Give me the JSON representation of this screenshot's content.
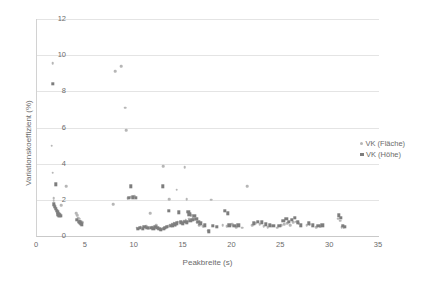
{
  "chart_data": {
    "type": "scatter",
    "title": "",
    "xlabel": "Peakbreite (s)",
    "ylabel": "Variationskoeffizient (%)",
    "xlim": [
      0,
      35
    ],
    "ylim": [
      0,
      12
    ],
    "xticks": [
      0,
      5,
      10,
      15,
      20,
      25,
      30,
      35
    ],
    "yticks": [
      0,
      2,
      4,
      6,
      8,
      10,
      12
    ],
    "grid": "horizontal",
    "legend_position": "right",
    "colors": {
      "flaeche": "#b6b6b6",
      "hoehe": "#7d7d7d",
      "gridline": "#e4e4e4",
      "axis": "#c9c9c9",
      "text": "#6b6b6b"
    },
    "series": [
      {
        "name": "VK (Fläche)",
        "marker": "circle",
        "color": "#b6b6b6",
        "points": [
          [
            1.6,
            9.55
          ],
          [
            1.5,
            5.0
          ],
          [
            1.6,
            3.5
          ],
          [
            1.7,
            2.1
          ],
          [
            1.7,
            1.95
          ],
          [
            1.8,
            1.7
          ],
          [
            1.9,
            1.55
          ],
          [
            2.0,
            1.45
          ],
          [
            2.1,
            1.3
          ],
          [
            2.3,
            1.2
          ],
          [
            2.5,
            1.7
          ],
          [
            3.0,
            2.75
          ],
          [
            4.0,
            1.25
          ],
          [
            4.1,
            1.15
          ],
          [
            4.2,
            1.0
          ],
          [
            4.3,
            0.95
          ],
          [
            4.4,
            0.85
          ],
          [
            4.5,
            0.8
          ],
          [
            4.6,
            0.75
          ],
          [
            7.8,
            1.75
          ],
          [
            8.0,
            9.1
          ],
          [
            8.6,
            9.4
          ],
          [
            9.0,
            7.1
          ],
          [
            9.1,
            5.85
          ],
          [
            9.3,
            2.1
          ],
          [
            9.6,
            2.15
          ],
          [
            10.0,
            2.2
          ],
          [
            10.2,
            0.45
          ],
          [
            10.4,
            0.4
          ],
          [
            10.6,
            0.5
          ],
          [
            10.9,
            0.45
          ],
          [
            11.2,
            0.55
          ],
          [
            11.4,
            0.4
          ],
          [
            11.6,
            1.25
          ],
          [
            11.8,
            0.5
          ],
          [
            12.0,
            0.45
          ],
          [
            12.2,
            0.6
          ],
          [
            12.4,
            0.4
          ],
          [
            12.6,
            0.35
          ],
          [
            12.8,
            0.4
          ],
          [
            12.9,
            3.85
          ],
          [
            13.0,
            0.45
          ],
          [
            13.2,
            0.5
          ],
          [
            13.4,
            0.55
          ],
          [
            13.5,
            2.05
          ],
          [
            13.6,
            0.6
          ],
          [
            13.8,
            0.65
          ],
          [
            14.0,
            0.7
          ],
          [
            14.2,
            0.6
          ],
          [
            14.3,
            2.55
          ],
          [
            14.4,
            0.75
          ],
          [
            14.6,
            0.8
          ],
          [
            14.8,
            0.7
          ],
          [
            15.0,
            0.85
          ],
          [
            15.1,
            3.8
          ],
          [
            15.2,
            0.9
          ],
          [
            15.3,
            2.05
          ],
          [
            15.4,
            0.8
          ],
          [
            15.6,
            0.95
          ],
          [
            15.8,
            1.15
          ],
          [
            16.0,
            1.0
          ],
          [
            16.2,
            0.9
          ],
          [
            16.4,
            0.75
          ],
          [
            16.6,
            0.6
          ],
          [
            17.0,
            0.55
          ],
          [
            17.5,
            0.3
          ],
          [
            17.8,
            2.0
          ],
          [
            19.0,
            0.6
          ],
          [
            19.4,
            0.55
          ],
          [
            20.0,
            0.65
          ],
          [
            20.4,
            0.5
          ],
          [
            21.0,
            0.45
          ],
          [
            21.5,
            2.75
          ],
          [
            22.0,
            0.6
          ],
          [
            22.4,
            0.7
          ],
          [
            22.8,
            0.65
          ],
          [
            23.2,
            0.55
          ],
          [
            23.6,
            0.5
          ],
          [
            24.6,
            0.45
          ],
          [
            25.0,
            0.6
          ],
          [
            25.3,
            0.65
          ],
          [
            25.6,
            0.7
          ],
          [
            25.9,
            0.6
          ],
          [
            26.2,
            0.75
          ],
          [
            26.5,
            0.8
          ],
          [
            26.8,
            0.7
          ],
          [
            27.6,
            0.6
          ],
          [
            27.9,
            0.65
          ],
          [
            28.6,
            0.5
          ],
          [
            29.0,
            0.55
          ],
          [
            30.8,
            0.95
          ],
          [
            31.0,
            0.85
          ],
          [
            31.2,
            0.5
          ],
          [
            31.4,
            0.45
          ]
        ]
      },
      {
        "name": "VK (Höhe)",
        "marker": "square",
        "color": "#7d7d7d",
        "points": [
          [
            1.6,
            8.4
          ],
          [
            1.9,
            2.85
          ],
          [
            1.7,
            1.75
          ],
          [
            1.8,
            1.6
          ],
          [
            1.9,
            1.5
          ],
          [
            2.0,
            1.4
          ],
          [
            2.1,
            1.3
          ],
          [
            2.2,
            1.2
          ],
          [
            2.3,
            1.15
          ],
          [
            2.4,
            1.1
          ],
          [
            4.1,
            0.9
          ],
          [
            4.3,
            0.8
          ],
          [
            4.4,
            0.75
          ],
          [
            4.5,
            0.7
          ],
          [
            4.6,
            0.65
          ],
          [
            9.6,
            2.75
          ],
          [
            9.4,
            2.1
          ],
          [
            9.8,
            2.15
          ],
          [
            10.1,
            2.1
          ],
          [
            10.3,
            0.4
          ],
          [
            10.5,
            0.45
          ],
          [
            10.8,
            0.4
          ],
          [
            11.0,
            0.5
          ],
          [
            11.3,
            0.45
          ],
          [
            11.7,
            0.45
          ],
          [
            11.9,
            0.4
          ],
          [
            12.1,
            0.5
          ],
          [
            12.3,
            0.45
          ],
          [
            12.5,
            0.4
          ],
          [
            12.7,
            0.35
          ],
          [
            12.9,
            2.75
          ],
          [
            13.0,
            0.4
          ],
          [
            13.1,
            0.45
          ],
          [
            13.3,
            0.5
          ],
          [
            13.5,
            1.4
          ],
          [
            13.7,
            0.55
          ],
          [
            13.9,
            0.6
          ],
          [
            14.1,
            0.65
          ],
          [
            14.3,
            0.7
          ],
          [
            14.5,
            1.3
          ],
          [
            14.7,
            0.75
          ],
          [
            14.9,
            0.7
          ],
          [
            15.1,
            0.8
          ],
          [
            15.3,
            0.75
          ],
          [
            15.5,
            1.35
          ],
          [
            15.6,
            1.2
          ],
          [
            15.7,
            0.85
          ],
          [
            15.9,
            0.9
          ],
          [
            16.1,
            1.1
          ],
          [
            16.3,
            0.95
          ],
          [
            16.5,
            0.8
          ],
          [
            16.7,
            0.7
          ],
          [
            17.2,
            0.6
          ],
          [
            17.6,
            0.25
          ],
          [
            18.0,
            0.55
          ],
          [
            18.4,
            0.5
          ],
          [
            19.2,
            1.4
          ],
          [
            19.5,
            1.25
          ],
          [
            19.7,
            0.6
          ],
          [
            20.2,
            0.55
          ],
          [
            20.6,
            0.6
          ],
          [
            22.2,
            0.7
          ],
          [
            22.6,
            0.8
          ],
          [
            23.0,
            0.75
          ],
          [
            23.4,
            0.65
          ],
          [
            23.8,
            0.6
          ],
          [
            24.2,
            0.55
          ],
          [
            24.8,
            0.55
          ],
          [
            25.2,
            0.85
          ],
          [
            25.5,
            0.95
          ],
          [
            25.8,
            0.8
          ],
          [
            26.1,
            0.9
          ],
          [
            26.4,
            1.0
          ],
          [
            26.7,
            0.75
          ],
          [
            27.0,
            0.6
          ],
          [
            27.8,
            0.7
          ],
          [
            28.2,
            0.6
          ],
          [
            28.8,
            0.55
          ],
          [
            29.2,
            0.6
          ],
          [
            30.9,
            1.15
          ],
          [
            31.1,
            1.0
          ],
          [
            31.3,
            0.55
          ],
          [
            31.5,
            0.5
          ]
        ]
      }
    ]
  }
}
